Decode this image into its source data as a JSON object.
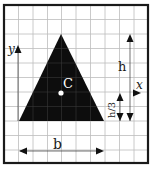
{
  "diagram": {
    "labels": {
      "y_axis": "y",
      "x_axis": "x",
      "centroid": "C",
      "height": "h",
      "height_third": "h/3",
      "base": "b"
    },
    "colors": {
      "triangle_fill": "#0d0d0d",
      "frame": "#1a1a1a",
      "grid": "#b8b8b8",
      "centroid_dot": "#ffffff"
    },
    "grid": {
      "cell_size_px": 14.4,
      "columns": 10,
      "rows": 11
    }
  }
}
